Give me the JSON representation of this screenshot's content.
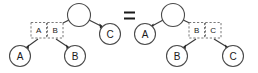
{
  "diagram": {
    "type": "tree-equivalence",
    "relation_symbol": "=",
    "left_tree": {
      "name": "left-tree",
      "root": {
        "label": "",
        "shape": "circle",
        "filled": false
      },
      "boxes": [
        {
          "label": "A",
          "style": "dashed"
        },
        {
          "label": "B",
          "style": "dashed"
        }
      ],
      "leaves": [
        {
          "label": "A",
          "shape": "circle"
        },
        {
          "label": "B",
          "shape": "circle"
        },
        {
          "label": "C",
          "shape": "circle"
        }
      ],
      "edges": [
        {
          "from": "root",
          "to": "box-group"
        },
        {
          "from": "root",
          "to": "C"
        },
        {
          "from": "box-A",
          "to": "A"
        },
        {
          "from": "box-B",
          "to": "B"
        }
      ]
    },
    "right_tree": {
      "name": "right-tree",
      "root": {
        "label": "",
        "shape": "circle",
        "filled": false
      },
      "boxes": [
        {
          "label": "B",
          "style": "dashed"
        },
        {
          "label": "C",
          "style": "dashed"
        }
      ],
      "leaves": [
        {
          "label": "A",
          "shape": "circle"
        },
        {
          "label": "B",
          "shape": "circle"
        },
        {
          "label": "C",
          "shape": "circle"
        }
      ],
      "edges": [
        {
          "from": "root",
          "to": "A"
        },
        {
          "from": "root",
          "to": "box-group"
        },
        {
          "from": "box-B",
          "to": "B"
        },
        {
          "from": "box-C",
          "to": "C"
        }
      ]
    },
    "colors": {
      "stroke": "#4a4a4a",
      "dashed_stroke": "#6a6a6a",
      "text": "#1a1a1a",
      "background": "#ffffff"
    }
  }
}
